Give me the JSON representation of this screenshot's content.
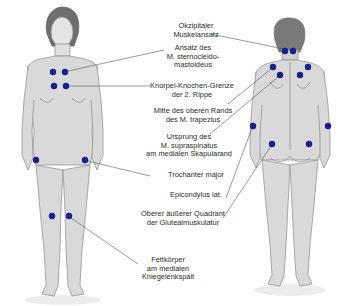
{
  "diagram": {
    "type": "anatomical-tender-points",
    "figures": [
      {
        "id": "front",
        "view": "anterior",
        "center_x": 63
      },
      {
        "id": "back",
        "view": "posterior",
        "center_x": 288
      }
    ],
    "colors": {
      "dot": "#1a1f8c",
      "body_fill": "#d9d9d9",
      "body_outline": "#8a8a8a",
      "hair": "#6e6e6e",
      "leader_line": "#555555",
      "text": "#2a2a2a"
    },
    "labels": [
      {
        "id": "okzipital",
        "text": "Okzipitaler\nMuskelansatz",
        "x": 196,
        "y": 22
      },
      {
        "id": "sternocleido",
        "text": "Ansatz des\nM. sternocleido-\nmastoideus",
        "x": 193,
        "y": 44
      },
      {
        "id": "knorpel",
        "text": "Knorpel-Knochen-Grenze\nder 2. Rippe",
        "x": 192,
        "y": 82
      },
      {
        "id": "trapezius",
        "text": "Mitte des oberen Rands\ndes M. trapezius",
        "x": 193,
        "y": 107
      },
      {
        "id": "supraspinatus",
        "text": "Ursprung des\nM. supraspinatus\nam medialen Skapularand",
        "x": 189,
        "y": 133
      },
      {
        "id": "trochanter",
        "text": "Trochanter major",
        "x": 196,
        "y": 171
      },
      {
        "id": "epicondylus",
        "text": "Epicondylus lat.",
        "x": 196,
        "y": 191
      },
      {
        "id": "gluteal",
        "text": "Oberer äußerer Quadrant\nder Glutealmuskulatur",
        "x": 183,
        "y": 210
      },
      {
        "id": "fettkoerper",
        "text": "Fettkörper\nam medialen\nKniegelenkspalt",
        "x": 168,
        "y": 256
      }
    ],
    "tender_points": [
      {
        "figure": "front",
        "site": "sternocleidomastoideus",
        "x": 53,
        "y": 72
      },
      {
        "figure": "front",
        "site": "sternocleidomastoideus",
        "x": 65,
        "y": 72
      },
      {
        "figure": "front",
        "site": "2nd-rib",
        "x": 54,
        "y": 86
      },
      {
        "figure": "front",
        "site": "2nd-rib",
        "x": 66,
        "y": 86
      },
      {
        "figure": "front",
        "site": "trochanter",
        "x": 36,
        "y": 160
      },
      {
        "figure": "front",
        "site": "trochanter",
        "x": 85,
        "y": 160
      },
      {
        "figure": "front",
        "site": "knee",
        "x": 52,
        "y": 216
      },
      {
        "figure": "front",
        "site": "knee",
        "x": 69,
        "y": 216
      },
      {
        "figure": "back",
        "site": "occiput",
        "x": 285,
        "y": 51
      },
      {
        "figure": "back",
        "site": "occiput",
        "x": 293,
        "y": 51
      },
      {
        "figure": "back",
        "site": "trapezius",
        "x": 273,
        "y": 67
      },
      {
        "figure": "back",
        "site": "trapezius",
        "x": 308,
        "y": 67
      },
      {
        "figure": "back",
        "site": "supraspinatus",
        "x": 280,
        "y": 75
      },
      {
        "figure": "back",
        "site": "supraspinatus",
        "x": 300,
        "y": 75
      },
      {
        "figure": "back",
        "site": "epicondylus",
        "x": 253,
        "y": 126
      },
      {
        "figure": "back",
        "site": "epicondylus",
        "x": 328,
        "y": 126
      },
      {
        "figure": "back",
        "site": "gluteal",
        "x": 272,
        "y": 144
      },
      {
        "figure": "back",
        "site": "gluteal",
        "x": 309,
        "y": 144
      }
    ],
    "leader_lines": [
      {
        "label": "okzipital",
        "x1": 211,
        "y1": 34,
        "x2": 284,
        "y2": 49
      },
      {
        "label": "sternocleido",
        "x1": 164,
        "y1": 50,
        "x2": 68,
        "y2": 71
      },
      {
        "label": "knorpel",
        "x1": 150,
        "y1": 86,
        "x2": 69,
        "y2": 86
      },
      {
        "label": "trapezius",
        "x1": 228,
        "y1": 104,
        "x2": 271,
        "y2": 69
      },
      {
        "label": "supraspinatus",
        "x1": 210,
        "y1": 134,
        "x2": 278,
        "y2": 77
      },
      {
        "label": "trochanter",
        "x1": 150,
        "y1": 176,
        "x2": 88,
        "y2": 161
      },
      {
        "label": "epicondylus",
        "x1": 226,
        "y1": 198,
        "x2": 252,
        "y2": 128
      },
      {
        "label": "gluteal",
        "x1": 223,
        "y1": 218,
        "x2": 271,
        "y2": 146
      },
      {
        "label": "fettkoerper",
        "x1": 138,
        "y1": 264,
        "x2": 71,
        "y2": 218
      }
    ]
  }
}
